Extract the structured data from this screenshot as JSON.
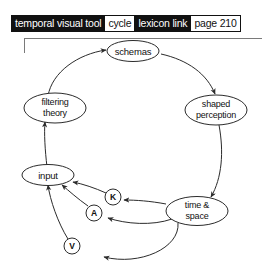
{
  "header": {
    "tags": [
      {
        "label": "temporal visual tool",
        "style": "dark"
      },
      {
        "label": "cycle",
        "style": "light"
      },
      {
        "label": "lexicon link",
        "style": "dark"
      },
      {
        "label": "page 210",
        "style": "light"
      }
    ]
  },
  "diagram": {
    "title": "cycle",
    "nodes": {
      "schemas": {
        "label": "schemas"
      },
      "shaped_perception": {
        "line1": "shaped",
        "line2": "perception"
      },
      "time_space": {
        "line1": "time &",
        "line2": "space"
      },
      "filtering_theory": {
        "line1": "filtering",
        "line2": "theory"
      },
      "input": {
        "label": "input"
      },
      "k": {
        "label": "K"
      },
      "a": {
        "label": "A"
      },
      "v": {
        "label": "V"
      }
    },
    "edges": [
      {
        "from": "filtering theory",
        "to": "schemas"
      },
      {
        "from": "schemas",
        "to": "shaped perception"
      },
      {
        "from": "shaped perception",
        "to": "time & space"
      },
      {
        "from": "time & space",
        "to": "K"
      },
      {
        "from": "time & space",
        "to": "A"
      },
      {
        "from": "time & space",
        "to": "V"
      },
      {
        "from": "K",
        "to": "input"
      },
      {
        "from": "A",
        "to": "input"
      },
      {
        "from": "V",
        "to": "input"
      },
      {
        "from": "input",
        "to": "filtering theory"
      }
    ]
  },
  "colors": {
    "ink": "#2b2b2b",
    "tag_dark_bg": "#111111",
    "tag_light_bg": "#ffffff",
    "rule": "#7a7a7a"
  }
}
